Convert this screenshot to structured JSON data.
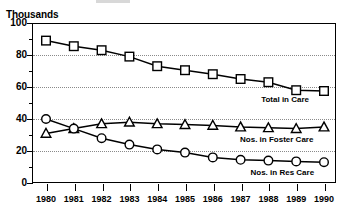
{
  "axis_title": "Thousands",
  "yaxis": {
    "major_labels": [
      "100",
      "80",
      "60",
      "40",
      "20",
      "0"
    ],
    "major_values": [
      100,
      80,
      60,
      40,
      20,
      0
    ],
    "minor_values": [
      90,
      70,
      50,
      30,
      10
    ],
    "gridline_values": [
      80,
      60,
      40,
      20
    ]
  },
  "xaxis": {
    "labels": [
      "1980",
      "1981",
      "1982",
      "1983",
      "1984",
      "1985",
      "1986",
      "1987",
      "1988",
      "1989",
      "1990"
    ]
  },
  "series_labels": {
    "total": "Total in Care",
    "foster": "Nos. in Foster Care",
    "res": "Nos. in Res Care"
  },
  "chart_data": {
    "type": "line",
    "title": "",
    "subtitle": "",
    "xlabel": "",
    "ylabel": "Thousands",
    "xlim": [
      1980,
      1990
    ],
    "ylim": [
      0,
      100
    ],
    "grid": true,
    "grid_axis": "y",
    "grid_style": "dotted",
    "legend_position": "inline-right-annotations",
    "x": [
      1980,
      1981,
      1982,
      1983,
      1984,
      1985,
      1986,
      1987,
      1988,
      1989,
      1990
    ],
    "xtick_labels": [
      "1980",
      "1981",
      "1982",
      "1983",
      "1984",
      "1985",
      "1986",
      "1987",
      "1988",
      "1989",
      "1990"
    ],
    "ytick_labels": [
      "0",
      "20",
      "40",
      "60",
      "80",
      "100"
    ],
    "ytick_values": [
      0,
      20,
      40,
      60,
      80,
      100
    ],
    "series": [
      {
        "name": "Total in Care",
        "marker": "square",
        "values": [
          89,
          85.5,
          83,
          79,
          73,
          70.5,
          68,
          65,
          63,
          58,
          57.5
        ]
      },
      {
        "name": "Nos. in Foster Care",
        "marker": "triangle",
        "values": [
          31,
          34,
          37,
          38,
          37,
          36.5,
          36,
          35,
          34.5,
          34,
          35
        ]
      },
      {
        "name": "Nos. in Res Care",
        "marker": "circle",
        "values": [
          40,
          34,
          28,
          24,
          21,
          19,
          16,
          14.5,
          14,
          13.5,
          13
        ]
      }
    ],
    "annotations": [
      {
        "text": "Total in Care",
        "x": 1988.6,
        "y": 52
      },
      {
        "text": "Nos. in Foster Care",
        "x": 1988.3,
        "y": 27
      },
      {
        "text": "Nos. in Res Care",
        "x": 1988.5,
        "y": 6
      }
    ]
  }
}
